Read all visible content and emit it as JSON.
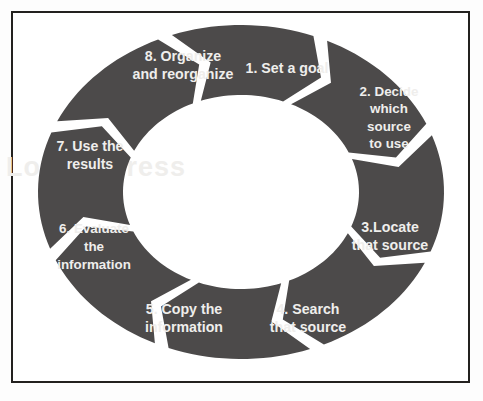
{
  "figure": {
    "background_color": "#ffffff",
    "frame_color": "#23211f",
    "segment_color": "#4c4a4a",
    "label_color": "#efeeec",
    "watermark_text": "Loyola Press"
  },
  "chart_data": {
    "type": "pie",
    "subtype": "cyclical-chevron-donut",
    "direction": "clockwise",
    "segment_count": 8,
    "categories": [
      "1. Set a goal",
      "2. Decide which source to use",
      "3.Locate that source",
      "4. Search that source",
      "5. Copy the information",
      "6. Evaluate the information",
      "7. Use the results",
      "8. Organize and reorganize"
    ],
    "values": [
      12.5,
      12.5,
      12.5,
      12.5,
      12.5,
      12.5,
      12.5,
      12.5
    ],
    "xlabel": "",
    "ylabel": "",
    "legend_position": "none",
    "grid": false
  },
  "steps": [
    {
      "number": "1",
      "name": "set-a-goal",
      "lines": [
        "1. Set a goal"
      ],
      "start_angle": -67,
      "end_angle": -22,
      "label_x": 287,
      "label_y": 68
    },
    {
      "number": "2",
      "name": "decide-which-source",
      "lines": [
        "2. Decide",
        "which",
        "source",
        "to use"
      ],
      "start_angle": -22,
      "end_angle": 23,
      "label_x": 389,
      "label_y": 117
    },
    {
      "number": "3",
      "name": "locate-that-source",
      "lines": [
        "3.Locate",
        "that source"
      ],
      "label_x": 390,
      "label_y": 236,
      "start_angle": 23,
      "end_angle": 68
    },
    {
      "number": "4",
      "name": "search-that-source",
      "lines": [
        "4. Search",
        "that source"
      ],
      "label_x": 308,
      "label_y": 318,
      "start_angle": 68,
      "end_angle": 113
    },
    {
      "number": "5",
      "name": "copy-the-information",
      "lines": [
        "5. Copy the",
        "information"
      ],
      "label_x": 184,
      "label_y": 318,
      "start_angle": 113,
      "end_angle": 158
    },
    {
      "number": "6",
      "name": "evaluate-the-information",
      "lines": [
        "6. Evaluate",
        "the",
        "information"
      ],
      "label_x": 94,
      "label_y": 246,
      "start_angle": 158,
      "end_angle": 203
    },
    {
      "number": "7",
      "name": "use-the-results",
      "lines": [
        "7. Use the",
        "results"
      ],
      "label_x": 90,
      "label_y": 155,
      "start_angle": 203,
      "end_angle": 248
    },
    {
      "number": "8",
      "name": "organize-and-reorganize",
      "lines": [
        "8. Organize",
        "and reorganize"
      ],
      "label_x": 183,
      "label_y": 65,
      "start_angle": 248,
      "end_angle": 293
    }
  ],
  "geometry": {
    "center_x": 241,
    "center_y": 192,
    "outer_rx": 203,
    "outer_ry": 167,
    "inner_rx": 118,
    "inner_ry": 97,
    "gap_degrees": 4.2,
    "chevron_depth_degrees": 9
  }
}
